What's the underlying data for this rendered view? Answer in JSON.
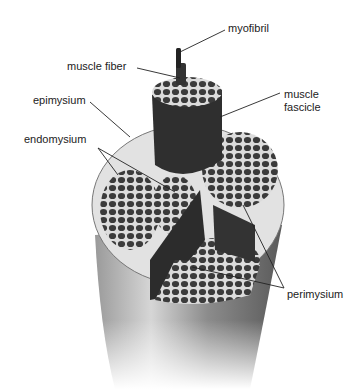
{
  "labels": {
    "myofibril": "myofibril",
    "muscle_fiber": "muscle fiber",
    "muscle_fascicle_line1": "muscle",
    "muscle_fascicle_line2": "fascicle",
    "epimysium": "epimysium",
    "endomysium": "endomysium",
    "perimysium": "perimysium"
  },
  "colors": {
    "fiber": "#3a3a3a",
    "connective": "#d8d8d8",
    "outer": "#8a8a8a",
    "line": "#222222"
  }
}
